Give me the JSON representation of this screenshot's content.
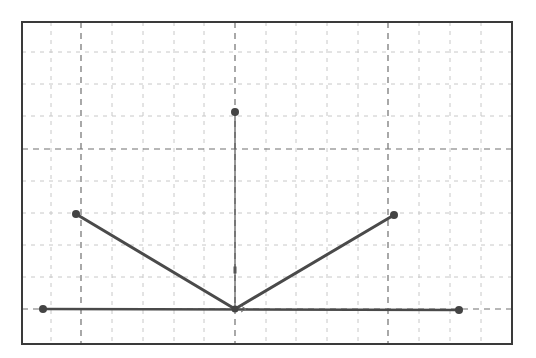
{
  "diagram": {
    "type": "vector-diagram-on-grid",
    "colors": {
      "background": "#ffffff",
      "frame": "#3a3a3a",
      "minor_grid": "#c8c8c8",
      "major_grid": "#707070",
      "segment": "#4a4a4a",
      "vertical_line": "#555555",
      "point": "#444444"
    },
    "frame": {
      "x1": 22,
      "y1": 22,
      "x2": 512,
      "y2": 344
    },
    "grid": {
      "vertical_lines_x": [
        51,
        81,
        112,
        143,
        174,
        204,
        235,
        266,
        296,
        327,
        358,
        388,
        419,
        450,
        481
      ],
      "major_vertical_x": [
        81,
        235,
        388
      ],
      "horizontal_lines_y": [
        52,
        84,
        116,
        149,
        181,
        213,
        245,
        277,
        309
      ],
      "major_horizontal_y": [
        149,
        309
      ],
      "style": "dashed"
    },
    "origin": {
      "x": 235,
      "y": 309
    },
    "points": [
      {
        "id": "left-baseline",
        "x": 43,
        "y": 309
      },
      {
        "id": "right-baseline",
        "x": 459,
        "y": 310
      },
      {
        "id": "left-upper",
        "x": 76,
        "y": 214
      },
      {
        "id": "right-upper",
        "x": 394,
        "y": 215
      },
      {
        "id": "top",
        "x": 235,
        "y": 112
      },
      {
        "id": "origin",
        "x": 235,
        "y": 309
      }
    ],
    "segments": [
      {
        "id": "baseline",
        "from": "left-baseline",
        "to": "right-baseline",
        "width": 2.5
      },
      {
        "id": "left-arm",
        "from": "left-upper",
        "to": "origin",
        "width": 3
      },
      {
        "id": "right-arm",
        "from": "origin",
        "to": "right-upper",
        "width": 3
      },
      {
        "id": "vertical",
        "from": "origin",
        "to": "top",
        "width": 1.2
      }
    ],
    "markers": [
      {
        "id": "vertical-tick",
        "x": 235,
        "y": 270,
        "w": 3,
        "h": 7
      },
      {
        "id": "origin-arrow",
        "x": 246,
        "y": 309
      }
    ]
  }
}
